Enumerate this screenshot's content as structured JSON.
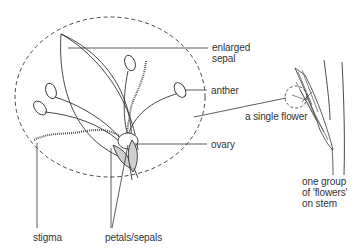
{
  "diagram": {
    "type": "labeled botanical illustration",
    "colors": {
      "line": "#333333",
      "fill_petals": "#cfcfcf",
      "background": "#ffffff",
      "text": "#333333"
    },
    "labels": {
      "enlarged_sepal_line1": "enlarged",
      "enlarged_sepal_line2": "sepal",
      "anther": "anther",
      "single_flower": "a single flower",
      "ovary": "ovary",
      "stigma": "stigma",
      "petals_sepals": "petals/sepals",
      "group_line1": "one group",
      "group_line2": "of 'flowers'",
      "group_line3": "on stem"
    }
  }
}
